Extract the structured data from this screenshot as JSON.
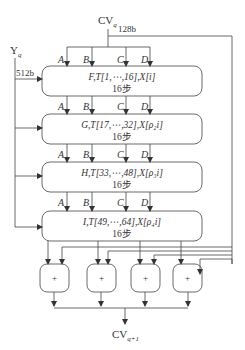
{
  "diagram": {
    "type": "MD5 compression function (HMD5) block diagram",
    "input_cv": {
      "label": "CV",
      "subscript": "q",
      "width_label": "128b"
    },
    "input_block": {
      "label": "Y",
      "subscript": "q",
      "width_label": "512b"
    },
    "register_labels": [
      "A",
      "B",
      "C",
      "D"
    ],
    "rounds": [
      {
        "func": "F",
        "t_range": "T[1,⋯,16]",
        "x_index": "X[i]",
        "steps": "16步"
      },
      {
        "func": "G",
        "t_range": "T[17,⋯,32]",
        "x_index": "X[ρ₂i]",
        "steps": "16步"
      },
      {
        "func": "H",
        "t_range": "T[33,⋯,48]",
        "x_index": "X[ρ₃i]",
        "steps": "16步"
      },
      {
        "func": "I",
        "t_range": "T[49,⋯,64]",
        "x_index": "X[ρ₄i]",
        "steps": "16步"
      }
    ],
    "round_text": [
      "F,T[1,⋯,16],X[i]",
      "G,T[17,⋯,32],X[ρ₂i]",
      "H,T[33,⋯,48],X[ρ₃i]",
      "I,T[49,⋯,64],X[ρ₄i]"
    ],
    "adder_symbol": "+",
    "adder_count": 4,
    "output_cv": {
      "label": "CV",
      "subscript": "q+1"
    },
    "line_color": "#444444"
  }
}
